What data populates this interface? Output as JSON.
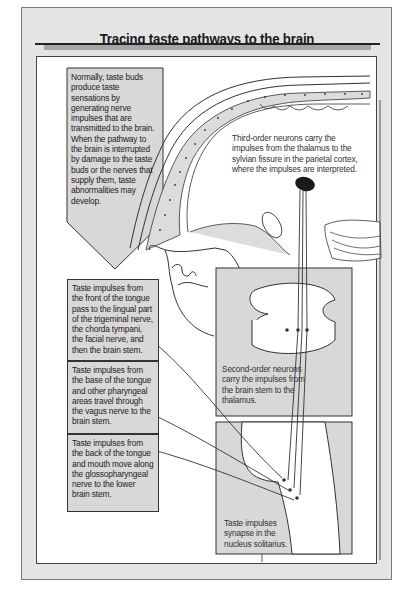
{
  "title": "Tracing taste pathways to the brain",
  "intro": {
    "text": "Normally, taste buds produce taste sensations by generating nerve impulses that are transmitted to the brain. When the pathway to the brain is interrupted by damage to the taste buds or the nerves that supply them, taste abnormalities may develop."
  },
  "callouts": {
    "front_tongue": "Taste impulses from the front of the tongue pass to the lingual part of the trigeminal nerve, the chorda tympani, the facial nerve, and then the brain stem.",
    "base_tongue": "Taste impulses from the base of the tongue and other pharyngeal areas travel through the vagus nerve to the brain stem.",
    "back_tongue": "Taste impulses from the back of the tongue and mouth move along the glossopharyngeal nerve to the lower brain stem."
  },
  "labels": {
    "third_order": "Third-order neurons carry the impulses from the thalamus to the sylvian fissure in the parietal cortex, where the impulses are interpreted.",
    "second_order": "Second-order neurons carry the impulses from the brain stem to the thalamus.",
    "synapse": "Taste impulses synapse in the nucleus solitarius."
  },
  "colors": {
    "frame_bg": "#e4e4e4",
    "box_bg": "#d8d8d8",
    "line": "#333333",
    "cortex_spot": "#1a1a1a"
  }
}
